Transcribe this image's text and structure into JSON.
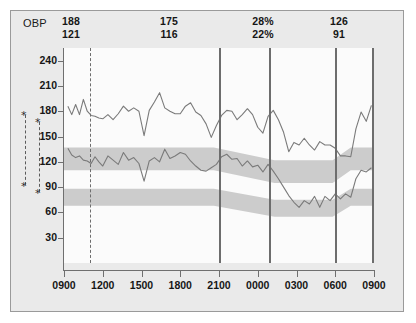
{
  "header": {
    "label": "OBP",
    "columns": [
      {
        "top": "188",
        "bottom": "121"
      },
      {
        "top": "175",
        "bottom": "116"
      },
      {
        "top": "28%",
        "bottom": "22%"
      },
      {
        "top": "126",
        "bottom": "91"
      }
    ]
  },
  "chart_data": {
    "type": "line",
    "title": "",
    "xlabel": "",
    "ylabel": "",
    "ylim": [
      0,
      255
    ],
    "yticks": [
      240,
      210,
      180,
      150,
      120,
      90,
      60,
      30
    ],
    "xticks": [
      "0900",
      "1200",
      "1500",
      "1800",
      "2100",
      "0000",
      "0300",
      "0600",
      "0900"
    ],
    "xlim_hours": [
      9,
      33
    ],
    "grid": false,
    "legend": "none",
    "line_color": "#7a7a7a",
    "band_color": "#cccccc",
    "plot_bg": "#fbfbfb",
    "series": [
      {
        "name": "Systolic",
        "x": [
          9.3,
          9.6,
          9.9,
          10.2,
          10.5,
          10.8,
          11.1,
          11.4,
          11.7,
          12.0,
          12.4,
          12.8,
          13.2,
          13.6,
          14.0,
          14.4,
          14.8,
          15.2,
          15.6,
          16.0,
          16.4,
          16.8,
          17.2,
          17.6,
          18.0,
          18.4,
          18.8,
          19.2,
          19.6,
          20.0,
          20.4,
          20.8,
          21.2,
          21.6,
          22.0,
          22.4,
          22.8,
          23.2,
          23.6,
          24.0,
          24.4,
          24.8,
          25.2,
          25.6,
          26.0,
          26.4,
          26.8,
          27.2,
          27.6,
          28.0,
          28.4,
          28.8,
          29.2,
          29.6,
          30.0,
          30.4,
          30.8,
          31.2,
          31.6,
          32.0,
          32.4,
          32.8
        ],
        "values": [
          186,
          176,
          188,
          176,
          194,
          180,
          175,
          174,
          172,
          171,
          176,
          170,
          177,
          186,
          180,
          184,
          180,
          151,
          181,
          191,
          202,
          184,
          180,
          177,
          177,
          186,
          190,
          179,
          175,
          165,
          149,
          163,
          175,
          181,
          180,
          170,
          176,
          183,
          176,
          161,
          154,
          174,
          181,
          170,
          155,
          132,
          143,
          140,
          148,
          140,
          134,
          144,
          140,
          140,
          136,
          127,
          127,
          126,
          159,
          179,
          168,
          187
        ]
      },
      {
        "name": "Diastolic",
        "x": [
          9.3,
          9.6,
          9.9,
          10.2,
          10.5,
          10.8,
          11.1,
          11.4,
          11.7,
          12.0,
          12.4,
          12.8,
          13.2,
          13.6,
          14.0,
          14.4,
          14.8,
          15.2,
          15.6,
          16.0,
          16.4,
          16.8,
          17.2,
          17.6,
          18.0,
          18.4,
          18.8,
          19.2,
          19.6,
          20.0,
          20.4,
          20.8,
          21.2,
          21.6,
          22.0,
          22.4,
          22.8,
          23.2,
          23.6,
          24.0,
          24.4,
          24.8,
          25.2,
          25.6,
          26.0,
          26.4,
          26.8,
          27.2,
          27.6,
          28.0,
          28.4,
          28.8,
          29.2,
          29.6,
          30.0,
          30.4,
          30.8,
          31.2,
          31.6,
          32.0,
          32.4,
          32.8
        ],
        "values": [
          136,
          128,
          125,
          127,
          122,
          121,
          118,
          126,
          120,
          115,
          127,
          122,
          117,
          131,
          122,
          125,
          118,
          97,
          121,
          125,
          120,
          135,
          124,
          127,
          131,
          129,
          121,
          115,
          110,
          109,
          113,
          117,
          126,
          129,
          123,
          124,
          115,
          121,
          114,
          116,
          108,
          117,
          109,
          100,
          90,
          80,
          72,
          66,
          74,
          70,
          79,
          66,
          79,
          74,
          82,
          76,
          82,
          78,
          100,
          110,
          108,
          113
        ]
      }
    ],
    "bands": [
      {
        "name": "systolic-normal-range",
        "upper_day": 137,
        "lower_day": 110,
        "upper_night": 122,
        "lower_night": 95,
        "transition_start_hour": 20.6,
        "transition_end_hour": 25.3,
        "transition_back_start_hour": 29.8,
        "transition_back_end_hour": 31.2
      },
      {
        "name": "diastolic-normal-range",
        "upper_day": 88,
        "lower_day": 68,
        "upper_night": 75,
        "lower_night": 55,
        "transition_start_hour": 20.6,
        "transition_end_hour": 25.3,
        "transition_back_start_hour": 29.8,
        "transition_back_end_hour": 31.2
      }
    ],
    "event_lines": [
      {
        "name": "medication-marker",
        "hour": 11.05,
        "style": "dashed"
      },
      {
        "name": "night-start-marker",
        "hour": 21.0,
        "style": "solid"
      },
      {
        "name": "sleep-marker",
        "hour": 24.9,
        "style": "solid"
      },
      {
        "name": "wake-marker",
        "hour": 30.0,
        "style": "solid"
      },
      {
        "name": "end-marker",
        "hour": 32.85,
        "style": "solid"
      }
    ],
    "annotations": [
      {
        "name": "significance-bracket-1",
        "symbol": "*"
      },
      {
        "name": "significance-bracket-2",
        "symbol": "*"
      }
    ]
  }
}
